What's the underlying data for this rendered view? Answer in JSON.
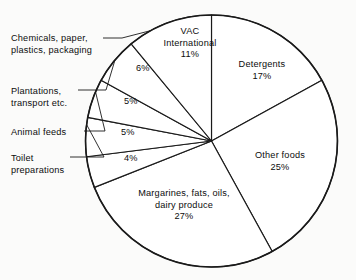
{
  "chart_data": {
    "type": "pie",
    "title": "",
    "subtitle": "",
    "xlabel": "",
    "ylabel": "",
    "legend_position": "none",
    "grid": false,
    "units": "percent",
    "start_angle_deg": 0,
    "direction": "clockwise",
    "total": 100,
    "categories": [
      "Detergents",
      "Other foods",
      "Margarines, fats, oils, dairy produce",
      "Toilet preparations",
      "Animal feeds",
      "Plantations, transport etc.",
      "Chemicals, paper, plastics, packaging",
      "VAC International"
    ],
    "values": [
      17,
      25,
      27,
      4,
      5,
      5,
      6,
      11
    ],
    "slices": [
      {
        "id": "detergents",
        "label_lines": [
          "Detergents"
        ],
        "value": 17,
        "value_text": "17%",
        "label_placement": "inside",
        "label_x": 262,
        "label_y": 66,
        "pct_x": 262,
        "pct_y": 78
      },
      {
        "id": "other-foods",
        "label_lines": [
          "Other foods"
        ],
        "value": 25,
        "value_text": "25%",
        "label_placement": "inside",
        "label_x": 278,
        "label_y": 157,
        "pct_x": 278,
        "pct_y": 169
      },
      {
        "id": "margarines-fats-oils-dairy",
        "label_lines": [
          "Margarines, fats, oils,",
          "dairy produce"
        ],
        "value": 27,
        "value_text": "27%",
        "label_placement": "inside",
        "label_x": 183,
        "label_y": 194,
        "pct_x": 183,
        "pct_y": 218
      },
      {
        "id": "toilet-preparations",
        "label_lines": [
          "Toilet",
          "preparations"
        ],
        "value": 4,
        "value_text": "4%",
        "label_placement": "callout",
        "label_x": 11,
        "label_y": 152,
        "pct_x": 124,
        "pct_y": 156
      },
      {
        "id": "animal-feeds",
        "label_lines": [
          "Animal feeds"
        ],
        "value": 5,
        "value_text": "5%",
        "label_placement": "callout",
        "label_x": 11,
        "label_y": 126,
        "pct_x": 121,
        "pct_y": 127
      },
      {
        "id": "plantations-transport",
        "label_lines": [
          "Plantations,",
          "transport etc."
        ],
        "value": 5,
        "value_text": "5%",
        "label_placement": "callout",
        "label_x": 11,
        "label_y": 85,
        "pct_x": 124,
        "pct_y": 102
      },
      {
        "id": "chemicals-paper-plastics-packaging",
        "label_lines": [
          "Chemicals, paper,",
          "plastics, packaging"
        ],
        "value": 6,
        "value_text": "6%",
        "label_placement": "callout",
        "label_x": 11,
        "label_y": 32,
        "pct_x": 136,
        "pct_y": 69
      },
      {
        "id": "vac-international",
        "label_lines": [
          "VAC",
          "International"
        ],
        "value": 11,
        "value_text": "11%",
        "label_placement": "inside",
        "label_x": 185,
        "label_y": 33,
        "pct_x": 185,
        "pct_y": 57
      }
    ],
    "geometry": {
      "center_x": 211.5,
      "center_y": 141,
      "radius": 126
    },
    "colors": {
      "slice_fill": "#ffffff",
      "stroke": "#1a1a1a",
      "text": "#0d0d0d",
      "background": "#fbfbfa"
    }
  }
}
